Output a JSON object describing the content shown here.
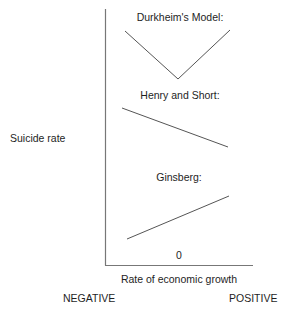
{
  "diagram": {
    "type": "line-sketch-comparison",
    "y_axis_label": "Suicide rate",
    "x_axis_label": "Rate of economic growth",
    "x_origin_label": "0",
    "x_left_label": "NEGATIVE",
    "x_right_label": "POSITIVE",
    "line_color": "#555555",
    "axis_color": "#777777",
    "models": [
      {
        "title": "Durkheim's Model:",
        "shape": "v",
        "description": "Suicide rate high at both negative and positive growth, lowest near zero",
        "points": [
          [
            125,
            31
          ],
          [
            178,
            79
          ],
          [
            230,
            30
          ]
        ]
      },
      {
        "title": "Henry and Short:",
        "shape": "decreasing",
        "description": "Suicide rate decreases as economic growth increases",
        "points": [
          [
            122,
            108
          ],
          [
            228,
            147
          ]
        ]
      },
      {
        "title": "Ginsberg:",
        "shape": "increasing",
        "description": "Suicide rate increases as economic growth increases",
        "points": [
          [
            127,
            239
          ],
          [
            229,
            196
          ]
        ]
      }
    ]
  }
}
